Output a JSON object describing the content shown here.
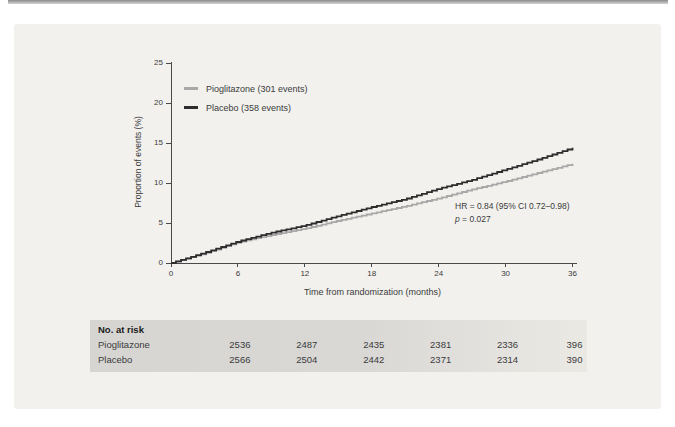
{
  "page": {
    "background_color": "#ffffff",
    "top_rule_color": "#8a8a8a",
    "panel_color": "#f2f1ee"
  },
  "chart_data": {
    "type": "line",
    "subtype": "kaplan-meier-cumulative-incidence",
    "title": "",
    "xlabel": "Time from randomization (months)",
    "ylabel": "Proportion of events (%)",
    "xlim": [
      0,
      36
    ],
    "ylim": [
      0,
      25
    ],
    "xticks": [
      0,
      6,
      12,
      18,
      24,
      30,
      36
    ],
    "yticks": [
      0,
      5,
      10,
      15,
      20,
      25
    ],
    "grid": false,
    "legend_position": "inside-top-left",
    "x_months": [
      0,
      3,
      6,
      9,
      12,
      15,
      18,
      21,
      24,
      27,
      30,
      33,
      36
    ],
    "series": [
      {
        "name": "Pioglitazone (301 events)",
        "color": "#a8a8a8",
        "values": [
          0,
          1.2,
          2.6,
          3.5,
          4.3,
          5.3,
          6.2,
          7.1,
          8.1,
          9.2,
          10.2,
          11.3,
          12.4
        ]
      },
      {
        "name": "Placebo (358 events)",
        "color": "#2d2d2d",
        "values": [
          0,
          1.3,
          2.7,
          3.8,
          4.7,
          5.9,
          7.0,
          8.0,
          9.3,
          10.4,
          11.7,
          13.0,
          14.4
        ]
      }
    ],
    "annotations": [
      "HR = 0.84 (95% CI 0.72–0.98)",
      "p = 0.027"
    ]
  },
  "annotation": {
    "hr_text": "HR = 0.84 (95% CI 0.72–0.98)",
    "p_italic": "p",
    "p_rest": " = 0.027"
  },
  "risk_table": {
    "title": "No. at risk",
    "months": [
      6,
      12,
      18,
      24,
      30,
      36
    ],
    "rows": [
      {
        "label": "Pioglitazone",
        "values": [
          2536,
          2487,
          2435,
          2381,
          2336,
          396
        ]
      },
      {
        "label": "Placebo",
        "values": [
          2566,
          2504,
          2442,
          2371,
          2314,
          390
        ]
      }
    ]
  }
}
